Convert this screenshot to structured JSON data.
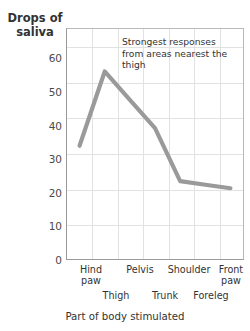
{
  "chart_data": {
    "type": "line",
    "title": "",
    "xlabel": "Part of body stimulated",
    "ylabel": "Drops of saliva",
    "ylabel_lines": [
      "Drops",
      "of",
      "saliva"
    ],
    "categories": [
      "Hind paw",
      "Thigh",
      "Pelvis",
      "Trunk",
      "Shoulder",
      "Foreleg",
      "Front paw"
    ],
    "values": [
      32,
      53,
      45,
      37,
      22,
      21,
      20
    ],
    "ylim": [
      0,
      65
    ],
    "yticks": [
      0,
      10,
      20,
      30,
      40,
      50,
      60
    ],
    "ytick_labels": [
      "0",
      "10",
      "20",
      "30",
      "40",
      "50",
      "60"
    ],
    "xtick_labels_top": [
      "Hind paw",
      "Pelvis",
      "Shoulder",
      "Front paw"
    ],
    "xtick_labels_bottom": [
      "Thigh",
      "Trunk",
      "Foreleg"
    ],
    "grid": true,
    "legend": "none",
    "line_color": "#9a9a9a",
    "grid_color": "#e2e2e2",
    "axis_color": "#9a9a9a",
    "annotations": [
      {
        "text": "Strongest responses from areas nearest the thigh",
        "lines": [
          "Strongest responses",
          "from areas nearest",
          "the thigh"
        ]
      }
    ]
  },
  "xtick_rows": {
    "top": [
      {
        "label_line1": "Hind",
        "label_line2": "paw"
      },
      {
        "label_line1": "Pelvis",
        "label_line2": ""
      },
      {
        "label_line1": "Shoulder",
        "label_line2": ""
      },
      {
        "label_line1": "Front",
        "label_line2": "paw"
      }
    ],
    "bottom": [
      {
        "label": "Thigh"
      },
      {
        "label": "Trunk"
      },
      {
        "label": "Foreleg"
      }
    ]
  }
}
